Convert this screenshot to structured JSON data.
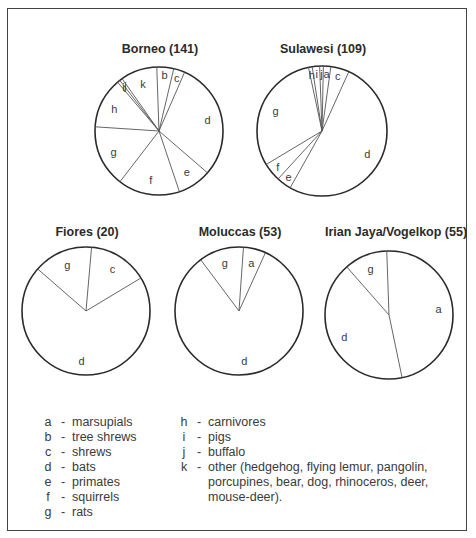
{
  "chart_data": [
    {
      "type": "pie",
      "title": "Borneo (141)",
      "total": 141,
      "slices": [
        {
          "key": "b",
          "value": 6
        },
        {
          "key": "c",
          "value": 4
        },
        {
          "key": "d",
          "value": 42
        },
        {
          "key": "e",
          "value": 12
        },
        {
          "key": "f",
          "value": 22
        },
        {
          "key": "g",
          "value": 22
        },
        {
          "key": "h",
          "value": 18
        },
        {
          "key": "i",
          "value": 1
        },
        {
          "key": "j",
          "value": 1
        },
        {
          "key": "k",
          "value": 13
        }
      ],
      "start_angle_deg": -2
    },
    {
      "type": "pie",
      "title": "Sulawesi (109)",
      "total": 109,
      "slices": [
        {
          "key": "h",
          "value": 1
        },
        {
          "key": "i",
          "value": 2
        },
        {
          "key": "j",
          "value": 1
        },
        {
          "key": "a",
          "value": 2
        },
        {
          "key": "c",
          "value": 5
        },
        {
          "key": "d",
          "value": 56
        },
        {
          "key": "e",
          "value": 4
        },
        {
          "key": "f",
          "value": 5
        },
        {
          "key": "g",
          "value": 33
        }
      ],
      "start_angle_deg": -12
    },
    {
      "type": "pie",
      "title": "Fiores (20)",
      "total": 20,
      "slices": [
        {
          "key": "c",
          "value": 3
        },
        {
          "key": "d",
          "value": 14
        },
        {
          "key": "g",
          "value": 3
        }
      ],
      "start_angle_deg": 5
    },
    {
      "type": "pie",
      "title": "Moluccas (53)",
      "total": 53,
      "slices": [
        {
          "key": "a",
          "value": 3
        },
        {
          "key": "d",
          "value": 44
        },
        {
          "key": "g",
          "value": 6
        }
      ],
      "start_angle_deg": 4
    },
    {
      "type": "pie",
      "title": "Irian Jaya/Vogelkop (55)",
      "total": 55,
      "slices": [
        {
          "key": "a",
          "value": 26
        },
        {
          "key": "d",
          "value": 23
        },
        {
          "key": "g",
          "value": 6
        }
      ],
      "start_angle_deg": -2
    }
  ],
  "legend": {
    "left": [
      {
        "key": "a",
        "label": "marsupials"
      },
      {
        "key": "b",
        "label": "tree shrews"
      },
      {
        "key": "c",
        "label": "shrews"
      },
      {
        "key": "d",
        "label": "bats"
      },
      {
        "key": "e",
        "label": "primates"
      },
      {
        "key": "f",
        "label": "squirrels"
      },
      {
        "key": "g",
        "label": "rats"
      }
    ],
    "right": [
      {
        "key": "h",
        "label": "carnivores"
      },
      {
        "key": "i",
        "label": "pigs"
      },
      {
        "key": "j",
        "label": "buffalo"
      },
      {
        "key": "k",
        "label": "other (hedgehog, flying lemur, pangolin, porcupines, bear, dog, rhinoceros, deer, mouse-deer)."
      }
    ],
    "separator": "-"
  },
  "colors": {
    "outline": "#2a2a2a",
    "divider": "#555555",
    "fill": "#ffffff"
  }
}
